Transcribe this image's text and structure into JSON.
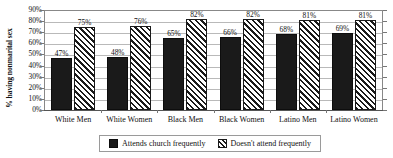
{
  "chart_data": {
    "type": "bar",
    "title": "",
    "subtitle": "",
    "xlabel": "",
    "ylabel": "% having nonmarital sex",
    "ylim": [
      0,
      90
    ],
    "ytick_step": 10,
    "ytick_labels": [
      "90%",
      "80%",
      "70%",
      "60%",
      "50%",
      "40%",
      "30%",
      "20%",
      "10%",
      "0%"
    ],
    "grid": true,
    "legend_position": "bottom-center",
    "categories": [
      "White Men",
      "White Women",
      "Black Men",
      "Black Women",
      "Latino Men",
      "Latino Women"
    ],
    "series": [
      {
        "name": "Attends church frequently",
        "style": "solid",
        "color": "#1a1a1a",
        "values": [
          47,
          48,
          65,
          66,
          68,
          69
        ],
        "labels": [
          "47%",
          "48%",
          "65%",
          "66%",
          "68%",
          "69%"
        ]
      },
      {
        "name": "Doesn't attend frequently",
        "style": "hatched",
        "color": "#1a1a1a",
        "values": [
          75,
          76,
          82,
          82,
          81,
          81
        ],
        "labels": [
          "75%",
          "76%",
          "82%",
          "82%",
          "81%",
          "81%"
        ]
      }
    ]
  },
  "legend": {
    "items": [
      {
        "label": "Attends church frequently",
        "swatch": "solid"
      },
      {
        "label": "Doesn't attend frequently",
        "swatch": "hatched"
      }
    ]
  }
}
